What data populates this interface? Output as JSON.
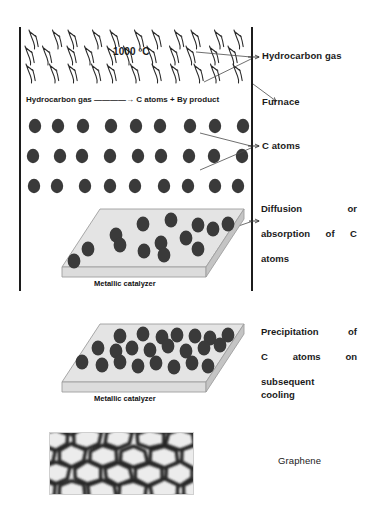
{
  "diagram": {
    "temperature_label": "1000 ºC",
    "reaction": "Hydrocarbon gas ————→ C atoms +  By product",
    "labels": {
      "hydrocarbon_gas": "Hydrocarbon gas",
      "furnace": "Furnace",
      "c_atoms": "C atoms",
      "diffusion_line1": "Diffusion or",
      "diffusion_line2": "absorption of C",
      "diffusion_line3": "atoms",
      "precipitation_line1": "Precipitation of",
      "precipitation_line2": "C atoms on",
      "precipitation_line3": "subsequent",
      "precipitation_line4": "cooling",
      "graphene": "Graphene"
    },
    "slab_upper_caption": "Metallic catalyzer",
    "slab_lower_caption": "Metallic catalyzer",
    "colors": {
      "atom_fill": "#3a3a3a",
      "slab_top": "#e4e4e4",
      "slab_side": "#c9c9c9",
      "wall": "#1c1c1c",
      "text": "#1a1a1a",
      "graphene_dark": "#2b2b2b",
      "graphene_light": "#ececec"
    },
    "gas_molecule_rows": 3,
    "gas_molecules_per_row": 11,
    "atom_grid": {
      "rows": 3,
      "columns": 9
    },
    "slab_upper_atom_count": 14,
    "slab_lower_atom_count": 23
  }
}
